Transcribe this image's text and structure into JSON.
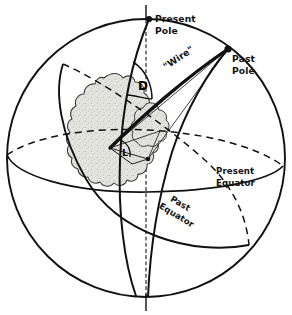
{
  "figure": {
    "kind": "paleomagnetic-pole-sphere-diagram",
    "background_color": "#ffffff",
    "ink_color": "#111111",
    "landmass_fill": "#dededa",
    "labels": {
      "present_pole_line1": "Present",
      "present_pole_line2": "Pole",
      "past_pole_line1": "Past",
      "past_pole_line2": "Pole",
      "wire": "\"Wire\"",
      "declination_angle": "D",
      "inclination_angle": "L",
      "present_equator_line1": "Present",
      "present_equator_line2": "Equator",
      "past_equator_line1": "Past",
      "past_equator_line2": "Equator"
    },
    "markers": {
      "present_pole_dot": "filled-dot",
      "past_pole_dot": "filled-dot",
      "site_dot": "filled-dot"
    },
    "elements": {
      "sphere_outline": "great-circle-outline",
      "spin_axis": "dash-dot-vertical-axis",
      "present_equator": "ellipse-solid-front-dashed-back",
      "past_equator": "tilted-ellipse-solid-front-dashed-back",
      "present_meridian": "meridian-arc-through-present-pole",
      "past_meridian": "meridian-arc-through-past-pole",
      "wire_arc": "thick-arc-site-to-past-pole",
      "continent": "stippled-landmass-blob"
    }
  }
}
